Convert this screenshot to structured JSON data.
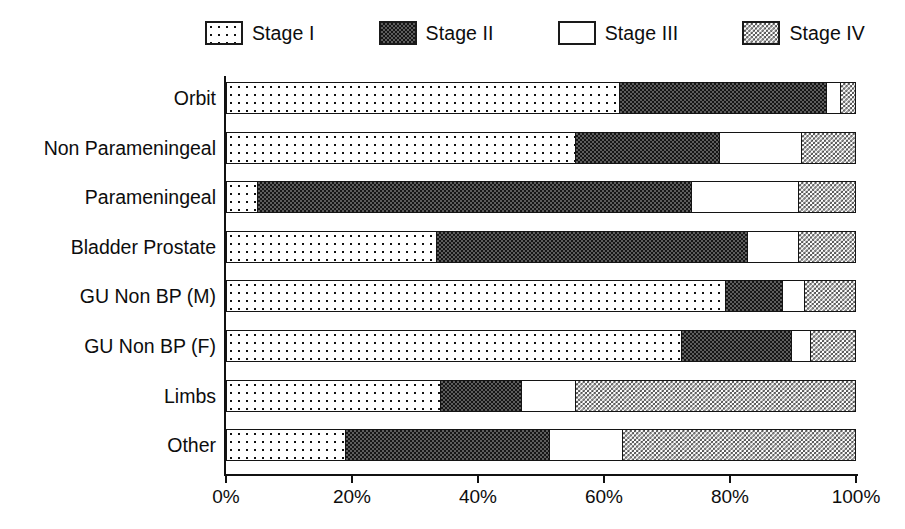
{
  "chart_data": {
    "type": "bar",
    "orientation": "horizontal",
    "stacked": true,
    "stack_mode": "percent",
    "title": "",
    "xlabel": "",
    "ylabel": "",
    "xlim": [
      0,
      100
    ],
    "grid": false,
    "legend_position": "top",
    "x_tick_labels": [
      "0%",
      "20%",
      "40%",
      "60%",
      "80%",
      "100%"
    ],
    "x_tick_values": [
      0,
      20,
      40,
      60,
      80,
      100
    ],
    "categories": [
      "Orbit",
      "Non Parameningeal",
      "Parameningeal",
      "Bladder Prostate",
      "GU Non BP (M)",
      "GU Non BP (F)",
      "Limbs",
      "Other"
    ],
    "series": [
      {
        "name": "Stage I",
        "pattern": "sparse-dots",
        "values": [
          62.5,
          55.5,
          5.0,
          33.5,
          79.5,
          72.5,
          34.0,
          19.0
        ]
      },
      {
        "name": "Stage II",
        "pattern": "dense-dark-checker",
        "values": [
          33.0,
          23.0,
          69.0,
          49.5,
          9.0,
          17.5,
          13.0,
          32.5
        ]
      },
      {
        "name": "Stage III",
        "pattern": "solid-white",
        "values": [
          2.3,
          13.0,
          17.0,
          8.0,
          3.5,
          3.0,
          8.5,
          11.5
        ]
      },
      {
        "name": "Stage IV",
        "pattern": "fine-light-checker",
        "values": [
          2.2,
          8.5,
          9.0,
          9.0,
          8.0,
          7.0,
          44.5,
          37.0
        ]
      }
    ]
  },
  "legend": {
    "items": [
      {
        "label": "Stage I",
        "pattern": "pat-s1"
      },
      {
        "label": "Stage II",
        "pattern": "pat-s2"
      },
      {
        "label": "Stage III",
        "pattern": "pat-s3"
      },
      {
        "label": "Stage IV",
        "pattern": "pat-s4"
      }
    ]
  },
  "colors": {
    "axis": "#111111",
    "text": "#0d0d0d",
    "background": "#ffffff",
    "stage1_ink": "#111111",
    "stage2_ink": "#161616",
    "stage3_fill": "#ffffff",
    "stage4_ink": "#4a4a4a"
  }
}
